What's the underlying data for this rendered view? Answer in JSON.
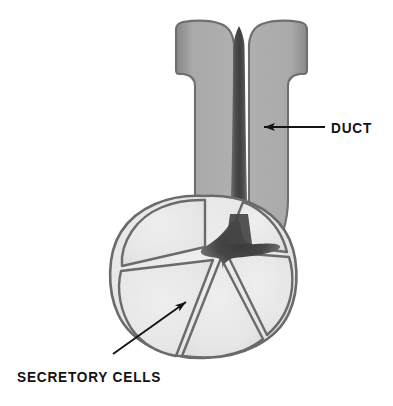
{
  "figure": {
    "background_color": "#ffffff",
    "width": 393,
    "height": 406,
    "style": "halftone grayscale textbook illustration"
  },
  "labels": [
    {
      "id": "duct",
      "text": "DUCT",
      "x": 331,
      "y": 119,
      "leader": {
        "type": "arrow",
        "direction": "left",
        "from_x": 325,
        "from_y": 127,
        "to_x": 262,
        "to_y": 127
      }
    },
    {
      "id": "secretory_cells",
      "text": "SECRETORY CELLS",
      "x": 17,
      "y": 368,
      "leader": {
        "type": "arrow",
        "direction": "up-right",
        "from_x": 113,
        "from_y": 354,
        "to_x": 187,
        "to_y": 301
      }
    }
  ],
  "structures": {
    "duct": {
      "name": "duct",
      "shape": "T-shaped tube with flared top flange",
      "fill_color": "#a9a9a9",
      "outline_color": "#6f6f6f",
      "flange_left": 178,
      "flange_right": 305,
      "flange_top": 20,
      "stalk_left": 196,
      "stalk_right": 281,
      "stalk_bottom": 232
    },
    "lumen": {
      "name": "lumen",
      "shape": "dark vertical channel widening to central star",
      "fill_color": "#4a4a4a",
      "center_x": 239,
      "center_y": 252
    },
    "acinus": {
      "name": "acinus",
      "shape": "rounded bulb",
      "outline_color": "#6b6b6b",
      "left": 112,
      "right": 296,
      "top": 194,
      "bottom": 358
    },
    "secretory_cells": {
      "name": "secretory cells",
      "count": 6,
      "shape": "wedge-shaped cells radiating from central lumen",
      "fill_color": "#e9e9e9",
      "outline_color": "#6b6b6b"
    }
  },
  "colors": {
    "background": "#ffffff",
    "duct_wall": "#a9a9a9",
    "duct_outline": "#6f6f6f",
    "lumen_dark": "#4a4a4a",
    "cell_fill": "#e9e9e9",
    "cell_outline": "#6b6b6b",
    "label_text": "#121212",
    "leader_line": "#141414"
  }
}
